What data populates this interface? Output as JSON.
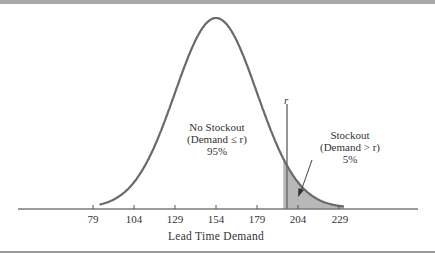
{
  "chart_data": {
    "type": "area",
    "title": "",
    "xlabel": "Lead Time Demand",
    "ylabel": "",
    "distribution": "normal",
    "mean": 154,
    "std_dev": 25,
    "x_ticks": [
      79,
      104,
      129,
      154,
      179,
      204,
      229
    ],
    "reorder_point_label": "r",
    "reorder_point_value": 195,
    "regions": [
      {
        "name": "No Stockout",
        "condition": "(Demand ≤ r)",
        "probability": "95%",
        "shaded": false
      },
      {
        "name": "Stockout",
        "condition": "(Demand > r)",
        "probability": "5%",
        "shaded": true
      }
    ],
    "grid": false,
    "legend": "none"
  },
  "annotations": {
    "no_stockout": {
      "line1": "No Stockout",
      "line2": "(Demand ≤ r)",
      "line3": "95%"
    },
    "stockout": {
      "line1": "Stockout",
      "line2": "(Demand > r)",
      "line3": "5%"
    },
    "r": "r"
  },
  "axis": {
    "ticks": [
      "79",
      "104",
      "129",
      "154",
      "179",
      "204",
      "229"
    ],
    "label": "Lead Time Demand"
  }
}
